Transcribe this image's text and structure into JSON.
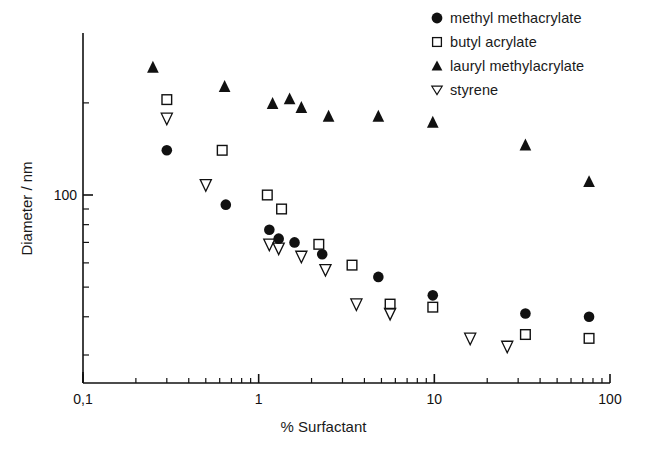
{
  "chart_data": {
    "type": "scatter",
    "title": "",
    "xlabel": "% Surfactant",
    "ylabel": "Diameter / nm",
    "xscale": "log",
    "yscale": "log",
    "xlim": [
      0.1,
      100
    ],
    "ylim": [
      20,
      280
    ],
    "grid": false,
    "legend_position": "top-right",
    "xticks": [
      {
        "value": 0.1,
        "label": "0,1"
      },
      {
        "value": 1,
        "label": "1"
      },
      {
        "value": 10,
        "label": "10"
      },
      {
        "value": 100,
        "label": "100"
      }
    ],
    "yticks": [
      {
        "value": 100,
        "label": "100"
      }
    ],
    "yminorticks": [
      30,
      40,
      50,
      60,
      70,
      80,
      90,
      200
    ],
    "series": [
      {
        "name": "methyl methacrylate",
        "marker": "filled-circle",
        "color": "#111111",
        "points": [
          {
            "x": 0.3,
            "y": 140
          },
          {
            "x": 0.65,
            "y": 93
          },
          {
            "x": 1.15,
            "y": 77
          },
          {
            "x": 1.3,
            "y": 72
          },
          {
            "x": 1.6,
            "y": 70
          },
          {
            "x": 2.3,
            "y": 64
          },
          {
            "x": 4.8,
            "y": 54
          },
          {
            "x": 9.8,
            "y": 47
          },
          {
            "x": 33,
            "y": 41
          },
          {
            "x": 76,
            "y": 40
          }
        ]
      },
      {
        "name": "butyl acrylate",
        "marker": "open-square",
        "color": "#111111",
        "points": [
          {
            "x": 0.3,
            "y": 205
          },
          {
            "x": 0.62,
            "y": 140
          },
          {
            "x": 1.12,
            "y": 100
          },
          {
            "x": 1.35,
            "y": 90
          },
          {
            "x": 2.2,
            "y": 69
          },
          {
            "x": 3.4,
            "y": 59
          },
          {
            "x": 5.6,
            "y": 44
          },
          {
            "x": 9.8,
            "y": 43
          },
          {
            "x": 33,
            "y": 35
          },
          {
            "x": 76,
            "y": 34
          }
        ]
      },
      {
        "name": "lauryl methylacrylate",
        "marker": "filled-triangle-up",
        "color": "#111111",
        "points": [
          {
            "x": 0.25,
            "y": 260
          },
          {
            "x": 0.64,
            "y": 225
          },
          {
            "x": 1.2,
            "y": 198
          },
          {
            "x": 1.5,
            "y": 205
          },
          {
            "x": 1.75,
            "y": 192
          },
          {
            "x": 2.5,
            "y": 180
          },
          {
            "x": 4.8,
            "y": 180
          },
          {
            "x": 9.8,
            "y": 172
          },
          {
            "x": 33,
            "y": 145
          },
          {
            "x": 76,
            "y": 110
          }
        ]
      },
      {
        "name": "styrene",
        "marker": "open-triangle-down",
        "color": "#111111",
        "points": [
          {
            "x": 0.3,
            "y": 178
          },
          {
            "x": 0.5,
            "y": 108
          },
          {
            "x": 1.15,
            "y": 69
          },
          {
            "x": 1.3,
            "y": 67
          },
          {
            "x": 1.75,
            "y": 63
          },
          {
            "x": 2.4,
            "y": 57
          },
          {
            "x": 3.6,
            "y": 44
          },
          {
            "x": 5.6,
            "y": 41
          },
          {
            "x": 16,
            "y": 34
          },
          {
            "x": 26,
            "y": 32
          }
        ]
      }
    ]
  },
  "legend": {
    "items": [
      {
        "label": "methyl methacrylate",
        "marker": "filled-circle"
      },
      {
        "label": "butyl acrylate",
        "marker": "open-square"
      },
      {
        "label": "lauryl methylacrylate",
        "marker": "filled-triangle-up"
      },
      {
        "label": "styrene",
        "marker": "open-triangle-down"
      }
    ]
  },
  "axes": {
    "x_title": "% Surfactant",
    "y_title": "Diameter / nm",
    "x_tick_labels": [
      "0,1",
      "1",
      "10",
      "100"
    ],
    "y_tick_labels": [
      "100"
    ]
  },
  "colors": {
    "ink": "#111111",
    "background": "#ffffff"
  }
}
